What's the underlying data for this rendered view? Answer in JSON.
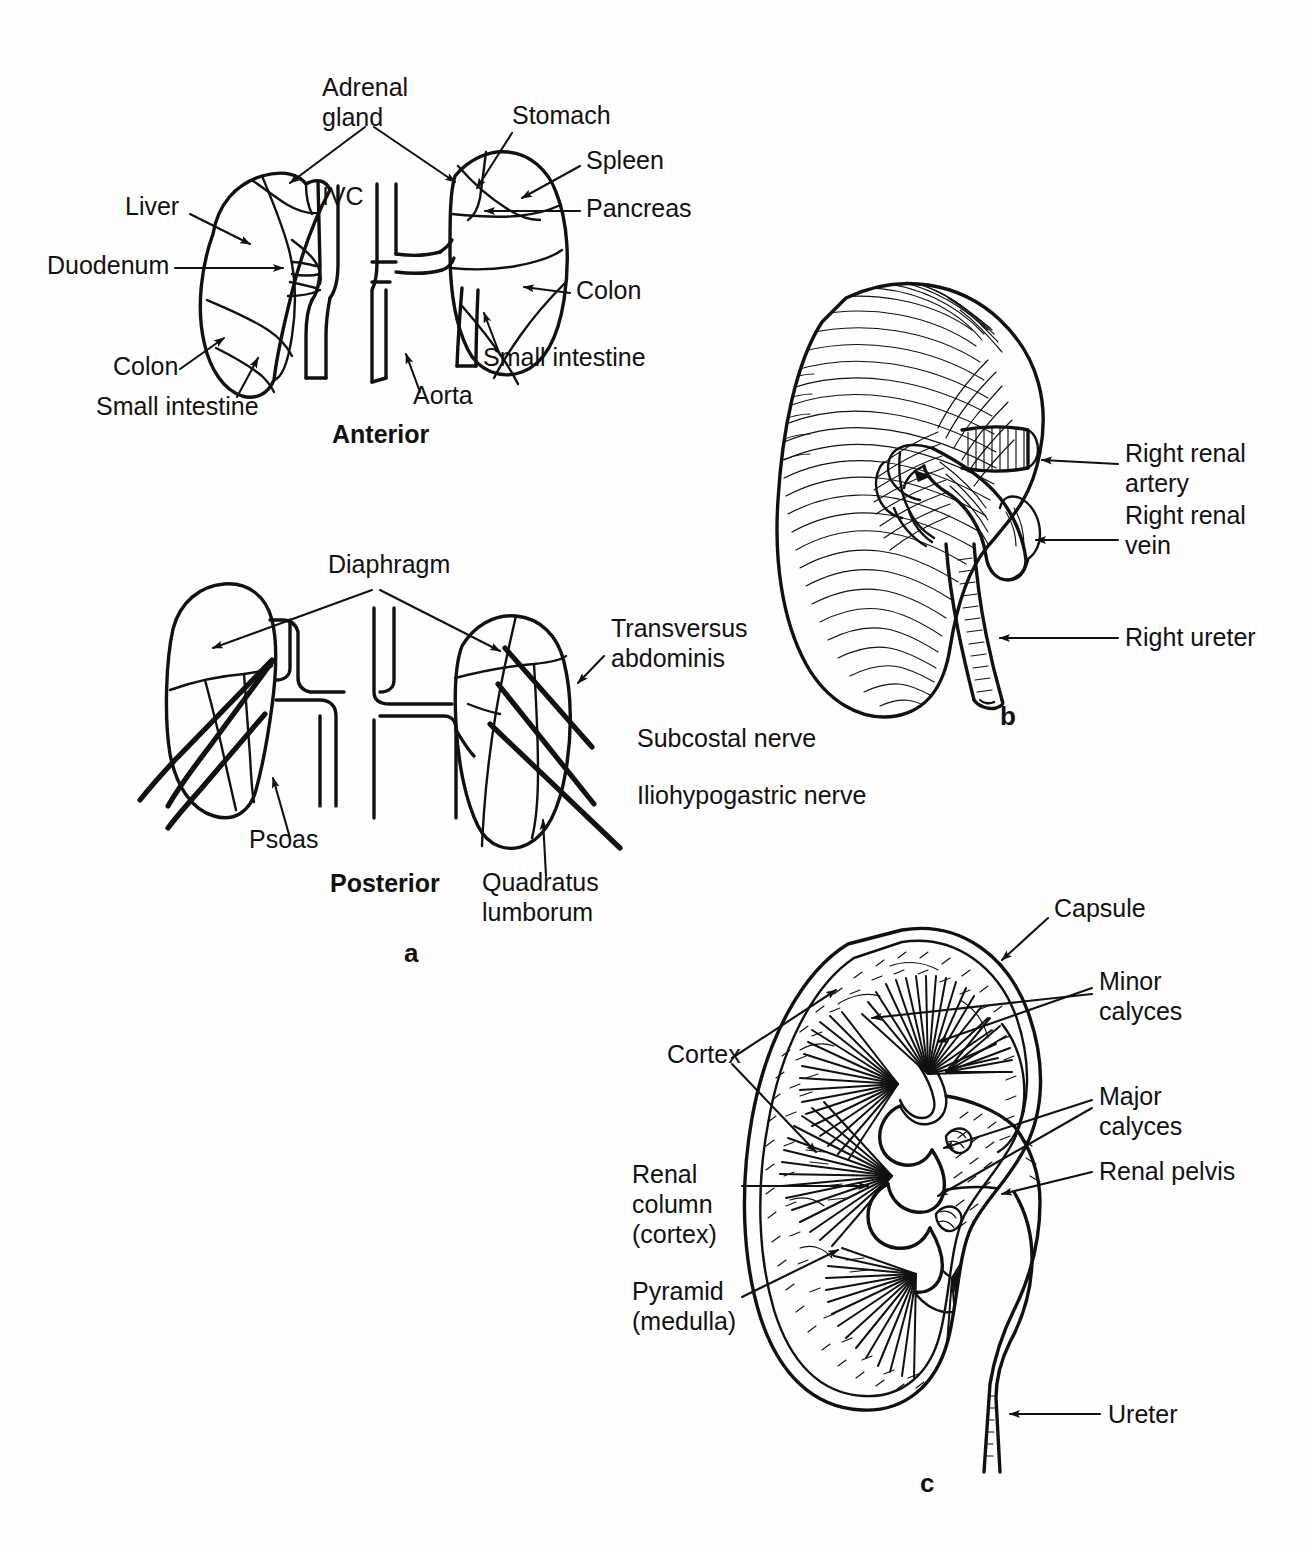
{
  "figure": {
    "background_color": "#fefefe",
    "ink_color": "#111111",
    "panel_marks": [
      {
        "id": "a",
        "label": "a",
        "x": 404,
        "y": 962
      },
      {
        "id": "b",
        "label": "b",
        "x": 1000,
        "y": 725
      },
      {
        "id": "c",
        "label": "c",
        "x": 920,
        "y": 1492
      }
    ]
  },
  "panel_a": {
    "name": "Relations of the kidneys",
    "views": [
      {
        "id": "anterior",
        "label": "Anterior",
        "x": 332,
        "y": 443
      },
      {
        "id": "posterior",
        "label": "Posterior",
        "x": 330,
        "y": 892
      }
    ],
    "anterior_labels": [
      {
        "id": "adrenal-gland",
        "lines": [
          "Adrenal",
          "gland"
        ],
        "x": 322,
        "y": 96,
        "anchor": "start"
      },
      {
        "id": "stomach",
        "lines": [
          "Stomach"
        ],
        "x": 512,
        "y": 124,
        "anchor": "start"
      },
      {
        "id": "spleen",
        "lines": [
          "Spleen"
        ],
        "x": 586,
        "y": 169,
        "anchor": "start"
      },
      {
        "id": "pancreas",
        "lines": [
          "Pancreas"
        ],
        "x": 586,
        "y": 217,
        "anchor": "start"
      },
      {
        "id": "colon-right",
        "lines": [
          "Colon"
        ],
        "x": 576,
        "y": 299,
        "anchor": "start"
      },
      {
        "id": "small-intestine-right",
        "lines": [
          "Small intestine"
        ],
        "x": 483,
        "y": 366,
        "anchor": "start"
      },
      {
        "id": "liver",
        "lines": [
          "Liver"
        ],
        "x": 125,
        "y": 215,
        "anchor": "start"
      },
      {
        "id": "duodenum",
        "lines": [
          "Duodenum"
        ],
        "x": 47,
        "y": 274,
        "anchor": "start"
      },
      {
        "id": "colon-left",
        "lines": [
          "Colon"
        ],
        "x": 113,
        "y": 375,
        "anchor": "start"
      },
      {
        "id": "small-intestine-left",
        "lines": [
          "Small intestine"
        ],
        "x": 96,
        "y": 415,
        "anchor": "start"
      },
      {
        "id": "ivc",
        "lines": [
          "IVC"
        ],
        "x": 322,
        "y": 205,
        "anchor": "start"
      },
      {
        "id": "aorta",
        "lines": [
          "Aorta"
        ],
        "x": 413,
        "y": 404,
        "anchor": "start"
      }
    ],
    "posterior_labels": [
      {
        "id": "diaphragm",
        "lines": [
          "Diaphragm"
        ],
        "x": 328,
        "y": 573,
        "anchor": "start"
      },
      {
        "id": "transversus-abdominis",
        "lines": [
          "Transversus",
          "abdominis"
        ],
        "x": 611,
        "y": 637,
        "anchor": "start"
      },
      {
        "id": "subcostal-nerve",
        "lines": [
          "Subcostal nerve"
        ],
        "x": 637,
        "y": 747,
        "anchor": "start"
      },
      {
        "id": "iliohypogastric-nerve",
        "lines": [
          "Iliohypogastric nerve"
        ],
        "x": 637,
        "y": 804,
        "anchor": "start"
      },
      {
        "id": "psoas",
        "lines": [
          "Psoas"
        ],
        "x": 249,
        "y": 848,
        "anchor": "start"
      },
      {
        "id": "quadratus-lumborum",
        "lines": [
          "Quadratus",
          "lumborum"
        ],
        "x": 482,
        "y": 891,
        "anchor": "start"
      }
    ]
  },
  "panel_b": {
    "name": "Right kidney, anterior surface with vessels",
    "labels": [
      {
        "id": "right-renal-artery",
        "lines": [
          "Right renal",
          "artery"
        ],
        "x": 1125,
        "y": 462,
        "anchor": "start"
      },
      {
        "id": "right-renal-vein",
        "lines": [
          "Right renal",
          "vein"
        ],
        "x": 1125,
        "y": 524,
        "anchor": "start"
      },
      {
        "id": "right-ureter",
        "lines": [
          "Right ureter"
        ],
        "x": 1125,
        "y": 642,
        "anchor": "start"
      }
    ]
  },
  "panel_c": {
    "name": "Coronal section of kidney",
    "labels": [
      {
        "id": "capsule",
        "lines": [
          "Capsule"
        ],
        "x": 1054,
        "y": 917,
        "anchor": "start"
      },
      {
        "id": "minor-calyces",
        "lines": [
          "Minor",
          "calyces"
        ],
        "x": 1099,
        "y": 990,
        "anchor": "start"
      },
      {
        "id": "major-calyces",
        "lines": [
          "Major",
          "calyces"
        ],
        "x": 1099,
        "y": 1105,
        "anchor": "start"
      },
      {
        "id": "renal-pelvis",
        "lines": [
          "Renal pelvis"
        ],
        "x": 1099,
        "y": 1176,
        "anchor": "start"
      },
      {
        "id": "cortex",
        "lines": [
          "Cortex"
        ],
        "x": 667,
        "y": 1063,
        "anchor": "start"
      },
      {
        "id": "renal-column",
        "lines": [
          "Renal",
          "column",
          "(cortex)"
        ],
        "x": 632,
        "y": 1183,
        "anchor": "start"
      },
      {
        "id": "pyramid",
        "lines": [
          "Pyramid",
          "(medulla)"
        ],
        "x": 632,
        "y": 1300,
        "anchor": "start"
      },
      {
        "id": "ureter",
        "lines": [
          "Ureter"
        ],
        "x": 1108,
        "y": 1420,
        "anchor": "start"
      }
    ]
  }
}
